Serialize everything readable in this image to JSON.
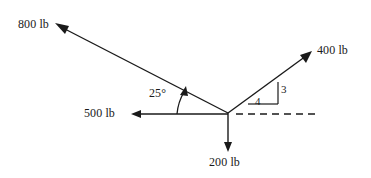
{
  "diagram": {
    "type": "force-vector-diagram",
    "stroke_color": "#1a1a1a",
    "background_color": "#ffffff",
    "origin": {
      "x": 228,
      "y": 113
    },
    "labels": {
      "force_800": "800 lb",
      "force_400": "400 lb",
      "force_500": "500 lb",
      "force_200": "200 lb",
      "angle_25": "25°",
      "slope_rise": "3",
      "slope_run": "4"
    },
    "vectors": [
      {
        "name": "force-800",
        "label": "800 lb",
        "magnitude": 800,
        "unit": "lb",
        "direction": "up-left",
        "angle_from_positive_x_deg": 205,
        "tip": {
          "x": 55,
          "y": 23
        },
        "tail": {
          "x": 228,
          "y": 113
        },
        "style": "solid-arrow"
      },
      {
        "name": "force-400",
        "label": "400 lb",
        "magnitude": 400,
        "unit": "lb",
        "direction": "up-right",
        "slope": "3-4",
        "tip": {
          "x": 311,
          "y": 52
        },
        "tail": {
          "x": 228,
          "y": 113
        },
        "style": "solid-arrow"
      },
      {
        "name": "force-500",
        "label": "500 lb",
        "magnitude": 500,
        "unit": "lb",
        "direction": "left",
        "angle_from_positive_x_deg": 180,
        "tip": {
          "x": 131,
          "y": 114
        },
        "tail": {
          "x": 228,
          "y": 114
        },
        "style": "solid-arrow"
      },
      {
        "name": "force-200",
        "label": "200 lb",
        "magnitude": 200,
        "unit": "lb",
        "direction": "down",
        "angle_from_positive_x_deg": 270,
        "tip": {
          "x": 228,
          "y": 151
        },
        "tail": {
          "x": 228,
          "y": 113
        },
        "style": "solid-arrow"
      }
    ],
    "annotations": [
      {
        "name": "angle-arc-25",
        "label": "25°",
        "value": 25,
        "unit": "degrees",
        "between": [
          "force-500",
          "force-800"
        ]
      },
      {
        "name": "slope-triangle",
        "rise": "3",
        "run": "4",
        "for_vector": "force-400"
      },
      {
        "name": "horizontal-reference-line",
        "style": "dashed",
        "from": {
          "x": 236,
          "y": 114
        },
        "to": {
          "x": 320,
          "y": 114
        }
      }
    ]
  }
}
